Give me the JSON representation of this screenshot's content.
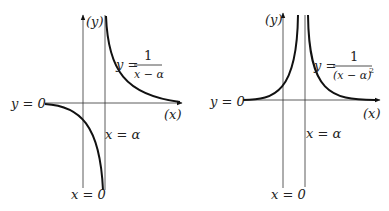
{
  "left_graph": {
    "y_axis_label": "(y)",
    "x_axis_label": "(x)",
    "horizontal_asymptote": "y = 0",
    "vertical_asymptote": "x = α",
    "y_axis_line": "x = 0",
    "equation": {
      "lhs": "y =",
      "numerator": "1",
      "denominator": "x − α"
    }
  },
  "right_graph": {
    "y_axis_label": "(y)",
    "x_axis_label": "(x)",
    "horizontal_asymptote": "y = 0",
    "vertical_asymptote": "x = α",
    "y_axis_line": "x = 0",
    "equation": {
      "lhs": "y =",
      "numerator": "1",
      "denominator": "(x − α)",
      "exponent": "2"
    }
  }
}
